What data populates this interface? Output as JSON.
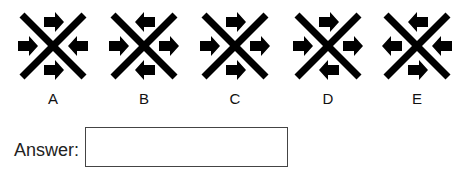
{
  "figures": [
    {
      "label": "A",
      "arrows": {
        "top": "right",
        "left": "right",
        "right": "left",
        "bottom": "right"
      }
    },
    {
      "label": "B",
      "arrows": {
        "top": "left",
        "left": "right",
        "right": "right",
        "bottom": "left"
      }
    },
    {
      "label": "C",
      "arrows": {
        "top": "right",
        "left": "right",
        "right": "right",
        "bottom": "right"
      }
    },
    {
      "label": "D",
      "arrows": {
        "top": "right",
        "left": "right",
        "right": "right",
        "bottom": "left"
      }
    },
    {
      "label": "E",
      "arrows": {
        "top": "left",
        "left": "left",
        "right": "left",
        "bottom": "right"
      }
    }
  ],
  "answer": {
    "label": "Answer:",
    "value": ""
  },
  "colors": {
    "ink": "#000000",
    "border": "#444444"
  }
}
